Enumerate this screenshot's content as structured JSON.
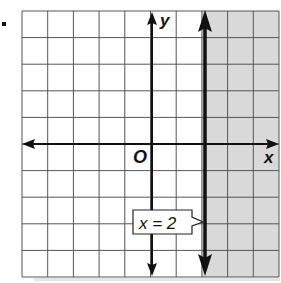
{
  "problem": {
    "bullet": "•"
  },
  "chart_data": {
    "type": "line",
    "title": "",
    "xlabel": "x",
    "ylabel": "y",
    "origin_label": "O",
    "xlim": [
      -5,
      5
    ],
    "ylim": [
      -5,
      5
    ],
    "grid": true,
    "grid_step": 1,
    "series": [
      {
        "name": "x = 2",
        "kind": "vertical-line",
        "x": 2,
        "style": "solid",
        "points": [
          [
            2,
            -5
          ],
          [
            2,
            5
          ]
        ]
      }
    ],
    "shaded_region": {
      "condition": "x > 2",
      "x_range": [
        2,
        5
      ],
      "y_range": [
        -5,
        5
      ],
      "color": "#d9d9d9"
    },
    "annotations": [
      {
        "text": "x = 2",
        "points_to": [
          2,
          -3
        ],
        "position": "left of line"
      }
    ],
    "colors": {
      "grid": "#555555",
      "axes": "#111111",
      "boundary": "#111111",
      "shade": "#d9d9d9"
    }
  },
  "labels": {
    "x_axis": "x",
    "y_axis": "y",
    "origin": "O",
    "equation": "x = 2"
  }
}
